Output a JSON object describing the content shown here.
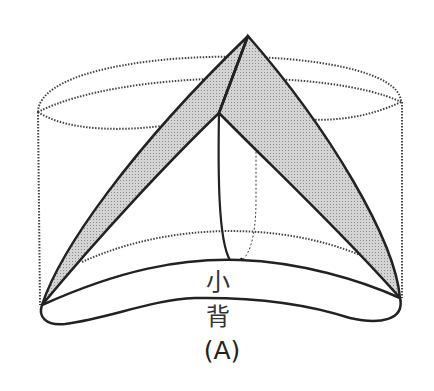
{
  "figure": {
    "region_label": "小 背",
    "caption": "(A)"
  },
  "colors": {
    "stroke": "#222222",
    "dotted": "#444444",
    "fill_gray": "#c8c8c8",
    "background": "#ffffff"
  }
}
